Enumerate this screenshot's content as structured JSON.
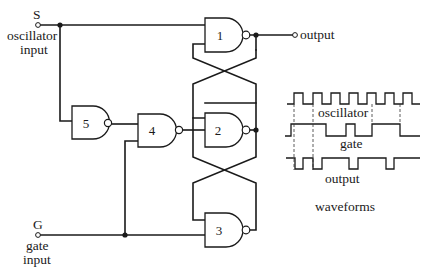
{
  "inputs": {
    "s": {
      "letter": "S",
      "line1": "oscillator",
      "line2": "input"
    },
    "g": {
      "letter": "G",
      "line1": "gate",
      "line2": "input"
    }
  },
  "output": {
    "label": "output"
  },
  "gates": [
    {
      "id": "1",
      "type": "NAND"
    },
    {
      "id": "2",
      "type": "NAND"
    },
    {
      "id": "3",
      "type": "NAND"
    },
    {
      "id": "4",
      "type": "NAND"
    },
    {
      "id": "5",
      "type": "NAND"
    }
  ],
  "waveforms": {
    "title": "waveforms",
    "signals": [
      {
        "name": "oscillator"
      },
      {
        "name": "gate"
      },
      {
        "name": "output"
      }
    ]
  },
  "colors": {
    "ink": "#1a1a1a",
    "background": "#ffffff"
  }
}
